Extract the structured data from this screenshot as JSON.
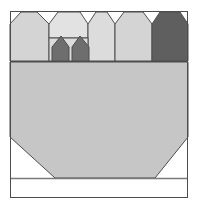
{
  "figure": {
    "width": 199,
    "height": 209,
    "background": "#ffffff",
    "outline_color": "#4d4d4d",
    "outline_width": 1,
    "frame": {
      "x": 10,
      "y": 11,
      "width": 178,
      "height": 187
    },
    "corner_mark": {
      "name": "corner-speck",
      "color": "#d8d8d8"
    }
  },
  "palette": {
    "light_gray": "#d4d4d4",
    "lighter_gray": "#dcdcdc",
    "pale_gray": "#e2e2e2",
    "mid_gray": "#c9c9c9",
    "body_gray": "#c6c6c6",
    "dark_gray": "#6e6e6e",
    "darker_gray": "#5f5f5f",
    "white": "#ffffff",
    "stroke": "#4d4d4d",
    "thin_stroke": "#7a7a7a"
  },
  "shapes": {
    "top_row_label": "roofline-band",
    "houses": [
      {
        "name": "house-1",
        "fill": "#d4d4d4",
        "points": "10,24 21,12 37,12 49,24 49,61 10,61"
      },
      {
        "name": "house-2",
        "fill": "#e2e2e2",
        "points": "49,24 58,12 80,12 88,24 88,38 49,38"
      },
      {
        "name": "house-3",
        "fill": "#dcdcdc",
        "points": "88,24 96,12 107,12 115,24 115,61 88,61"
      },
      {
        "name": "house-4",
        "fill": "#d4d4d4",
        "points": "115,24 124,12 143,12 152,24 152,61 115,61"
      },
      {
        "name": "house-5",
        "fill": "#5f5f5f",
        "points": "152,24 160,12 180,12 188,24 188,61 152,61"
      }
    ],
    "dark_houses": [
      {
        "name": "dark-house-1",
        "fill": "#6e6e6e",
        "points": "52,47 61,36 69,47 69,61 52,61"
      },
      {
        "name": "dark-house-2",
        "fill": "#6e6e6e",
        "points": "72,47 80,36 89,47 89,61 72,61"
      }
    ],
    "band_divider": {
      "name": "band-divider",
      "y": 61,
      "x1": 10,
      "x2": 188,
      "color": "#4d4d4d"
    },
    "body": {
      "name": "body-trapezoid",
      "fill": "#c6c6c6",
      "points": "10,62 188,62 188,137 155,178 55,178 10,137"
    },
    "baseline": {
      "name": "baseline-rule",
      "y": 178,
      "x1": 10,
      "x2": 188,
      "color": "#7a7a7a"
    },
    "footer": {
      "name": "footer-panel",
      "fill": "#ffffff",
      "x": 10,
      "y": 178,
      "width": 178,
      "height": 20
    },
    "inner_divider": {
      "name": "inner-divider",
      "x": 49,
      "y1": 12,
      "y2": 61,
      "color": "#4d4d4d"
    },
    "sub_divider": {
      "name": "sub-divider",
      "y": 38,
      "x1": 49,
      "x2": 88,
      "color": "#4d4d4d"
    }
  }
}
